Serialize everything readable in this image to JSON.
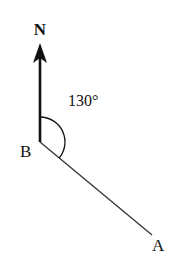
{
  "diagram": {
    "type": "bearing-diagram",
    "north_label": "N",
    "point_b_label": "B",
    "point_a_label": "A",
    "angle_label": "130°",
    "angle_degrees": 130,
    "colors": {
      "stroke": "#111111",
      "background": "#ffffff"
    }
  }
}
